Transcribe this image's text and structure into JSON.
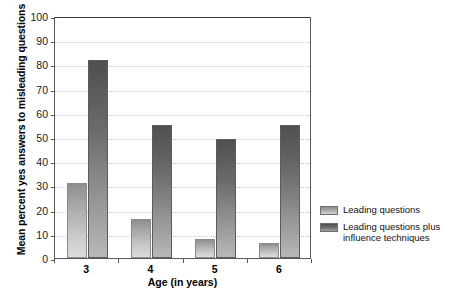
{
  "chart_data": {
    "type": "bar",
    "title": "",
    "xlabel": "Age (in years)",
    "ylabel": "Mean percent yes answers to misleading questions",
    "categories": [
      "3",
      "4",
      "5",
      "6"
    ],
    "ylim": [
      0,
      100
    ],
    "yticks": [
      0,
      10,
      20,
      30,
      40,
      50,
      60,
      70,
      80,
      90,
      100
    ],
    "ytick_labels": [
      "0",
      "10",
      "20",
      "30",
      "40",
      "50",
      "60",
      "70",
      "80",
      "90",
      "100"
    ],
    "grid": true,
    "legend_position": "right",
    "series": [
      {
        "name": "Leading questions",
        "color": "#b5b5b5",
        "values": [
          31,
          16,
          8,
          6
        ]
      },
      {
        "name": "Leading questions plus influence techniques",
        "color": "#6b6b6b",
        "values": [
          82,
          55,
          49,
          55
        ]
      }
    ]
  },
  "legend": {
    "entries": [
      {
        "label": "Leading questions"
      },
      {
        "label": "Leading questions plus influence techniques"
      }
    ]
  }
}
